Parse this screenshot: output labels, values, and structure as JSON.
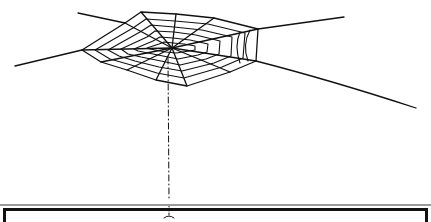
{
  "illustration": {
    "subject": "spider web hanging from a thread",
    "colors": {
      "ink": "#111111",
      "background": "#ffffff",
      "frame_shadow": "#9a9a9a"
    }
  }
}
